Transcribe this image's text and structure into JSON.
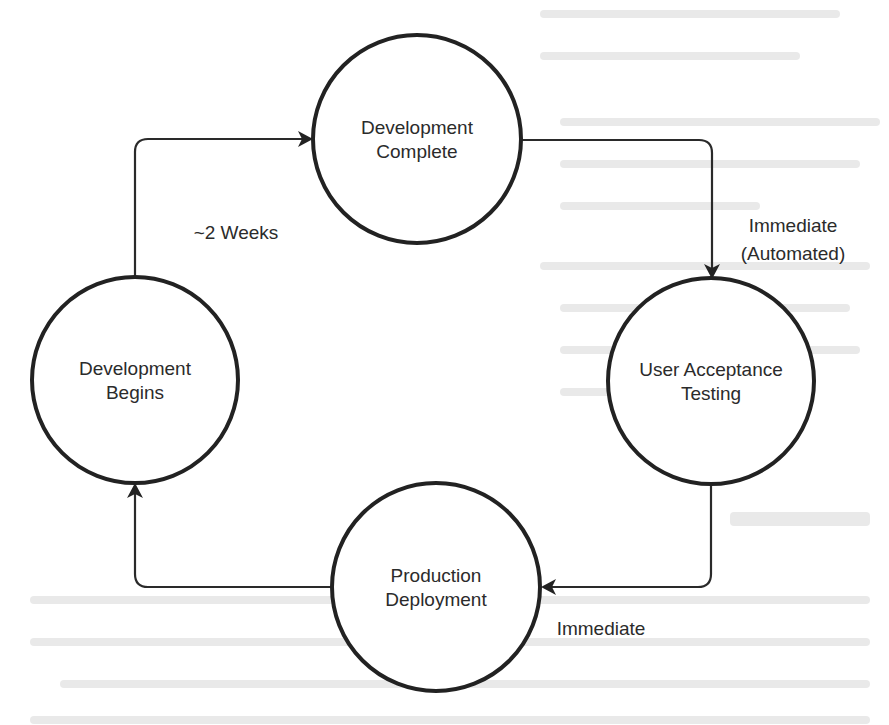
{
  "diagram": {
    "type": "cycle",
    "nodes": [
      {
        "id": "dev-complete",
        "line1": "Development",
        "line2": "Complete"
      },
      {
        "id": "uat",
        "line1": "User Acceptance",
        "line2": "Testing"
      },
      {
        "id": "prod-deploy",
        "line1": "Production",
        "line2": "Deployment"
      },
      {
        "id": "dev-begins",
        "line1": "Development",
        "line2": "Begins"
      }
    ],
    "edges": [
      {
        "from": "dev-begins",
        "to": "dev-complete",
        "label": "~2 Weeks"
      },
      {
        "from": "dev-complete",
        "to": "uat",
        "label_line1": "Immediate",
        "label_line2": "(Automated)"
      },
      {
        "from": "uat",
        "to": "prod-deploy",
        "label": "Immediate"
      },
      {
        "from": "prod-deploy",
        "to": "dev-begins",
        "label": ""
      }
    ]
  },
  "colors": {
    "stroke": "#222222",
    "text": "#2b2b2b",
    "background": "#ffffff",
    "bleed_through": "#e9e9e9"
  }
}
